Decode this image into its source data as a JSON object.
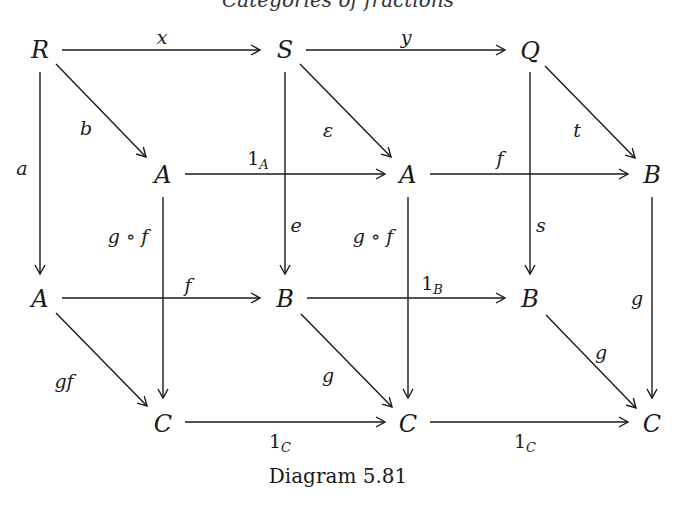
{
  "header": {
    "partial_title": "Categories of fractions"
  },
  "caption": "Diagram 5.81",
  "nodes": {
    "R": "R",
    "S": "S",
    "Q": "Q",
    "A1": "A",
    "A2": "A",
    "B1": "B",
    "A3": "A",
    "B2": "B",
    "B3": "B",
    "C1": "C",
    "C2": "C",
    "C3": "C"
  },
  "labels": {
    "x": "x",
    "y": "y",
    "b": "b",
    "eps": "ε",
    "t": "t",
    "a": "a",
    "e": "e",
    "s": "s",
    "oneA_main": "1",
    "oneA_sub": "A",
    "f_top": "f",
    "gof_1": "g ∘ f",
    "gof_2": "g ∘ f",
    "g_right": "g",
    "f_mid": "f",
    "oneB_main": "1",
    "oneB_sub": "B",
    "gf": "gf",
    "g_mid": "g",
    "g_diag": "g",
    "oneC1_main": "1",
    "oneC1_sub": "C",
    "oneC2_main": "1",
    "oneC2_sub": "C"
  },
  "colors": {
    "ink": "#1a1a1a",
    "background": "#ffffff"
  }
}
